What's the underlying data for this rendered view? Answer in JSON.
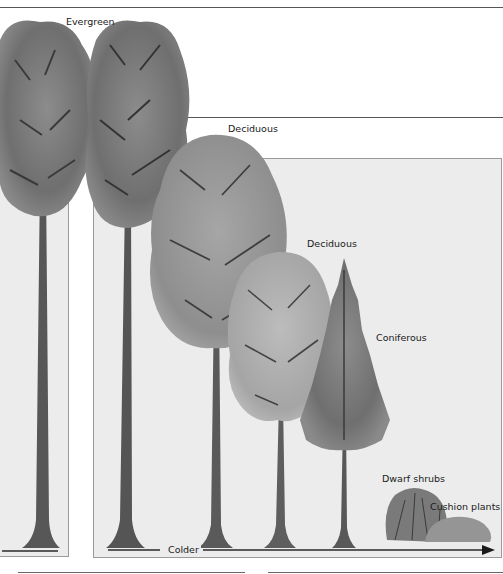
{
  "diagram": {
    "type": "vegetation-zones-illustration",
    "style": "grayscale watercolor",
    "labels": [
      {
        "id": "evergreen",
        "text": "Evergreen"
      },
      {
        "id": "deciduous-1",
        "text": "Deciduous"
      },
      {
        "id": "deciduous-2",
        "text": "Deciduous"
      },
      {
        "id": "coniferous",
        "text": "Coniferous"
      },
      {
        "id": "dwarf-shrubs",
        "text": "Dwarf shrubs"
      },
      {
        "id": "cushion-plants",
        "text": "Cushion plants"
      }
    ],
    "axis": {
      "label": "Colder",
      "direction": "left-to-right"
    },
    "plants": [
      {
        "name": "Evergreen tree",
        "count": 2,
        "relative_height": "tallest"
      },
      {
        "name": "Deciduous tree",
        "count": 1,
        "relative_height": "tall"
      },
      {
        "name": "Deciduous tree",
        "count": 1,
        "relative_height": "medium"
      },
      {
        "name": "Coniferous tree",
        "count": 1,
        "relative_height": "short"
      },
      {
        "name": "Dwarf shrubs",
        "count": 1,
        "relative_height": "very short"
      },
      {
        "name": "Cushion plants",
        "count": 1,
        "relative_height": "lowest"
      }
    ],
    "colors": {
      "panel_background": "#ececec",
      "rule": "#555555",
      "foliage_dark": "#6e6e6e",
      "foliage_light": "#a8a8a8",
      "trunk": "#4a4a4a"
    }
  }
}
